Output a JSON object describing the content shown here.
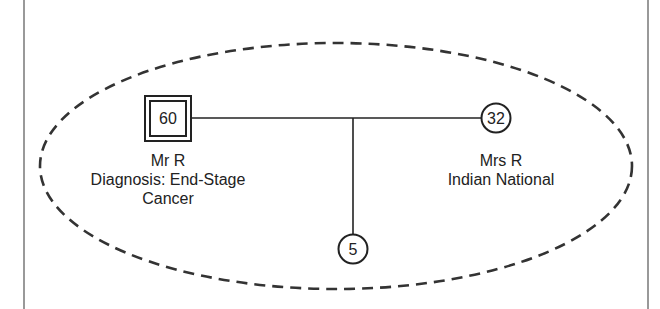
{
  "diagram": {
    "type": "genogram",
    "colors": {
      "stroke": "#222222",
      "frame": "#555555",
      "background": "#ffffff"
    },
    "household_boundary": {
      "style": "dashed-ellipse"
    },
    "nodes": [
      {
        "id": "mr-r",
        "shape": "double-square",
        "sex": "male",
        "age": "60",
        "name": "Mr R",
        "notes": [
          "Diagnosis: End-Stage",
          "Cancer"
        ],
        "role": "index-person"
      },
      {
        "id": "mrs-r",
        "shape": "circle",
        "sex": "female",
        "age": "32",
        "name": "Mrs R",
        "notes": [
          "Indian National"
        ]
      },
      {
        "id": "child",
        "shape": "circle",
        "sex": "female",
        "age": "5"
      }
    ],
    "relationships": [
      {
        "type": "marriage",
        "from": "mr-r",
        "to": "mrs-r"
      },
      {
        "type": "child",
        "parents": [
          "mr-r",
          "mrs-r"
        ],
        "child": "child"
      }
    ]
  }
}
